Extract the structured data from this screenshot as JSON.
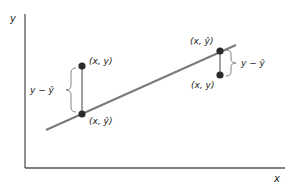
{
  "diagram": {
    "axes": {
      "x_label": "x",
      "y_label": "y"
    },
    "regression_line": {
      "color": "#7a7a7a"
    },
    "points": {
      "color": "#2b2b2b",
      "left_observed_label": "(x, y)",
      "left_predicted_label": "(x, ŷ)",
      "right_predicted_label": "(x, ŷ)",
      "right_observed_label": "(x, y)"
    },
    "residuals": {
      "left_label": "y − ŷ",
      "right_label": "y − ŷ"
    }
  }
}
